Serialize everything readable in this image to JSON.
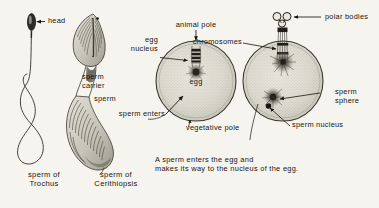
{
  "figure": {
    "background_color": "#f6f4ee",
    "ink_color": "#17160f",
    "caption": "A sperm enters the egg and\nmakes its way to the nucleus of the egg."
  },
  "labels": {
    "head": "head",
    "sperm_carrier": "sperm\ncarrier",
    "sperm": "sperm",
    "egg_nucleus": "egg\nnucleus",
    "animal_pole": "animal pole",
    "chromosomes": "chromosomes",
    "polar_bodies": "polar bodies",
    "egg": "egg",
    "sperm_enters": "sperm enters",
    "vegetative_pole": "vegetative pole",
    "sperm_sphere": "sperm\nsphere",
    "sperm_nucleus": "sperm nucleus"
  },
  "specimens": [
    {
      "name": "sperm of\nTrochus",
      "genus": "Trochus"
    },
    {
      "name": "sperm of\nCerithiopsis",
      "genus": "Cerithiopsis"
    }
  ],
  "icons": {
    "arrow_left": "arrow-left-icon",
    "arrow_down": "arrow-down-icon",
    "leader_line": "leader-line-icon"
  }
}
